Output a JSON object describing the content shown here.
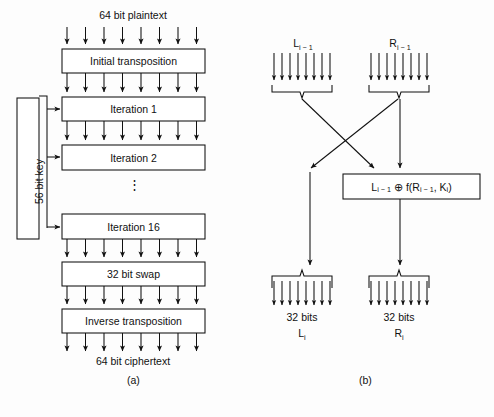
{
  "figure": {
    "background_color": "#fdfdfd",
    "stroke_color": "#111111",
    "captions": {
      "panel_a": "(a)",
      "panel_b": "(b)"
    }
  },
  "panel_a": {
    "name": "overall DES encryption flow",
    "input_label": "64 bit plaintext",
    "output_label": "64 bit ciphertext",
    "key_box_label": "56 bit key",
    "ellipsis": "⋮",
    "boxes": [
      {
        "label": "Initial transposition"
      },
      {
        "label": "Iteration 1"
      },
      {
        "label": "Iteration 2"
      },
      {
        "label": "Iteration 16"
      },
      {
        "label": "32 bit swap"
      },
      {
        "label": "Inverse transposition"
      }
    ],
    "bus_width_arrows": 8
  },
  "panel_b": {
    "name": "single DES iteration detail",
    "input_left_label": "L",
    "input_left_sub": "i − 1",
    "input_right_label": "R",
    "input_right_sub": "i − 1",
    "function_box": {
      "left_term": "L",
      "left_sub": "i − 1",
      "operator": "⊕",
      "func": "f(R",
      "func_sub": "i − 1",
      "func_mid": ", K",
      "func_sub2": "i",
      "func_end": ")",
      "full_text": "L i−1 ⊕ f(R i−1 , K i )"
    },
    "output_left": {
      "bits": "32 bits",
      "symbol": "L",
      "symbol_sub": "i"
    },
    "output_right": {
      "bits": "32 bits",
      "symbol": "R",
      "symbol_sub": "i"
    },
    "bus_width_arrows": 8
  }
}
